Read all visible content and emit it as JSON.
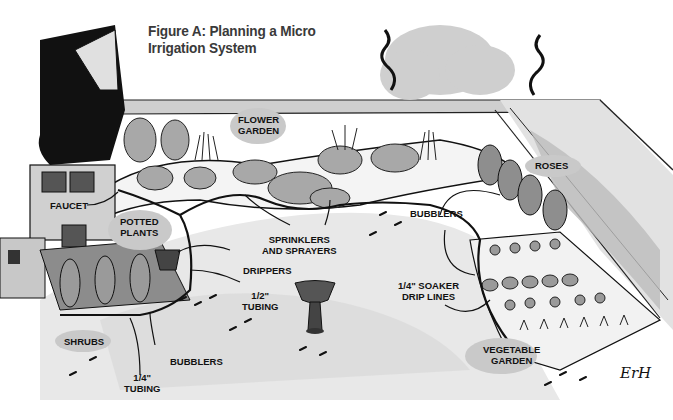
{
  "figure": {
    "title_line1": "Figure A: Planning a Micro",
    "title_line2": "Irrigation System",
    "signature": "ErH"
  },
  "labels": {
    "flower_garden": {
      "line1": "FLOWER",
      "line2": "GARDEN"
    },
    "roses": {
      "line1": "ROSES"
    },
    "faucet": {
      "line1": "FAUCET"
    },
    "potted_plants": {
      "line1": "POTTED",
      "line2": "PLANTS"
    },
    "sprinklers": {
      "line1": "SPRINKLERS",
      "line2": "AND SPRAYERS"
    },
    "bubblers_right": {
      "line1": "BUBBLERS"
    },
    "drippers": {
      "line1": "DRIPPERS"
    },
    "half_inch_tubing": {
      "line1": "1/2\"",
      "line2": "TUBING"
    },
    "soaker": {
      "line1": "1/4\" SOAKER",
      "line2": "DRIP LINES"
    },
    "shrubs": {
      "line1": "SHRUBS"
    },
    "bubblers_left": {
      "line1": "BUBBLERS"
    },
    "quarter_inch_tubing": {
      "line1": "1/4\"",
      "line2": "TUBING"
    },
    "vegetable_garden": {
      "line1": "VEGETABLE",
      "line2": "GARDEN"
    }
  },
  "colors": {
    "ink": "#111111",
    "wash_light": "#d6d6d6",
    "wash_mid": "#b8b8b8",
    "label_oval": "#c9c9c9",
    "paper": "#ffffff"
  }
}
